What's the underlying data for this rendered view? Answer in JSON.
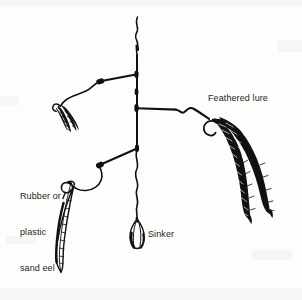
{
  "diagram": {
    "background_color": "#fdfdfc",
    "ink_color": "#111111",
    "labels": {
      "feathered_lure": "Feathered lure",
      "sinker": "Sinker",
      "sand_eel_line1": "Rubber or",
      "sand_eel_line2": "plastic",
      "sand_eel_line3": "sand eel"
    },
    "parts": [
      {
        "name": "main-line",
        "description": "vertical wavy monofilament main line"
      },
      {
        "name": "upper-dropper-branch",
        "description": "dropper loop to small feathered lure, upper left"
      },
      {
        "name": "small-feathered-lure",
        "description": "small dark feather tuft on hook"
      },
      {
        "name": "right-dropper-branch",
        "description": "horizontal dropper to large feathered lure"
      },
      {
        "name": "large-feathered-lure",
        "description": "two long dark feather plumes on hook"
      },
      {
        "name": "lower-dropper-branch",
        "description": "dropper loop to rubber or plastic sand eel"
      },
      {
        "name": "sand-eel-lure",
        "description": "outlined elongated soft plastic eel on hook"
      },
      {
        "name": "sinker",
        "description": "teardrop shaped weight at bottom of main line"
      }
    ]
  }
}
